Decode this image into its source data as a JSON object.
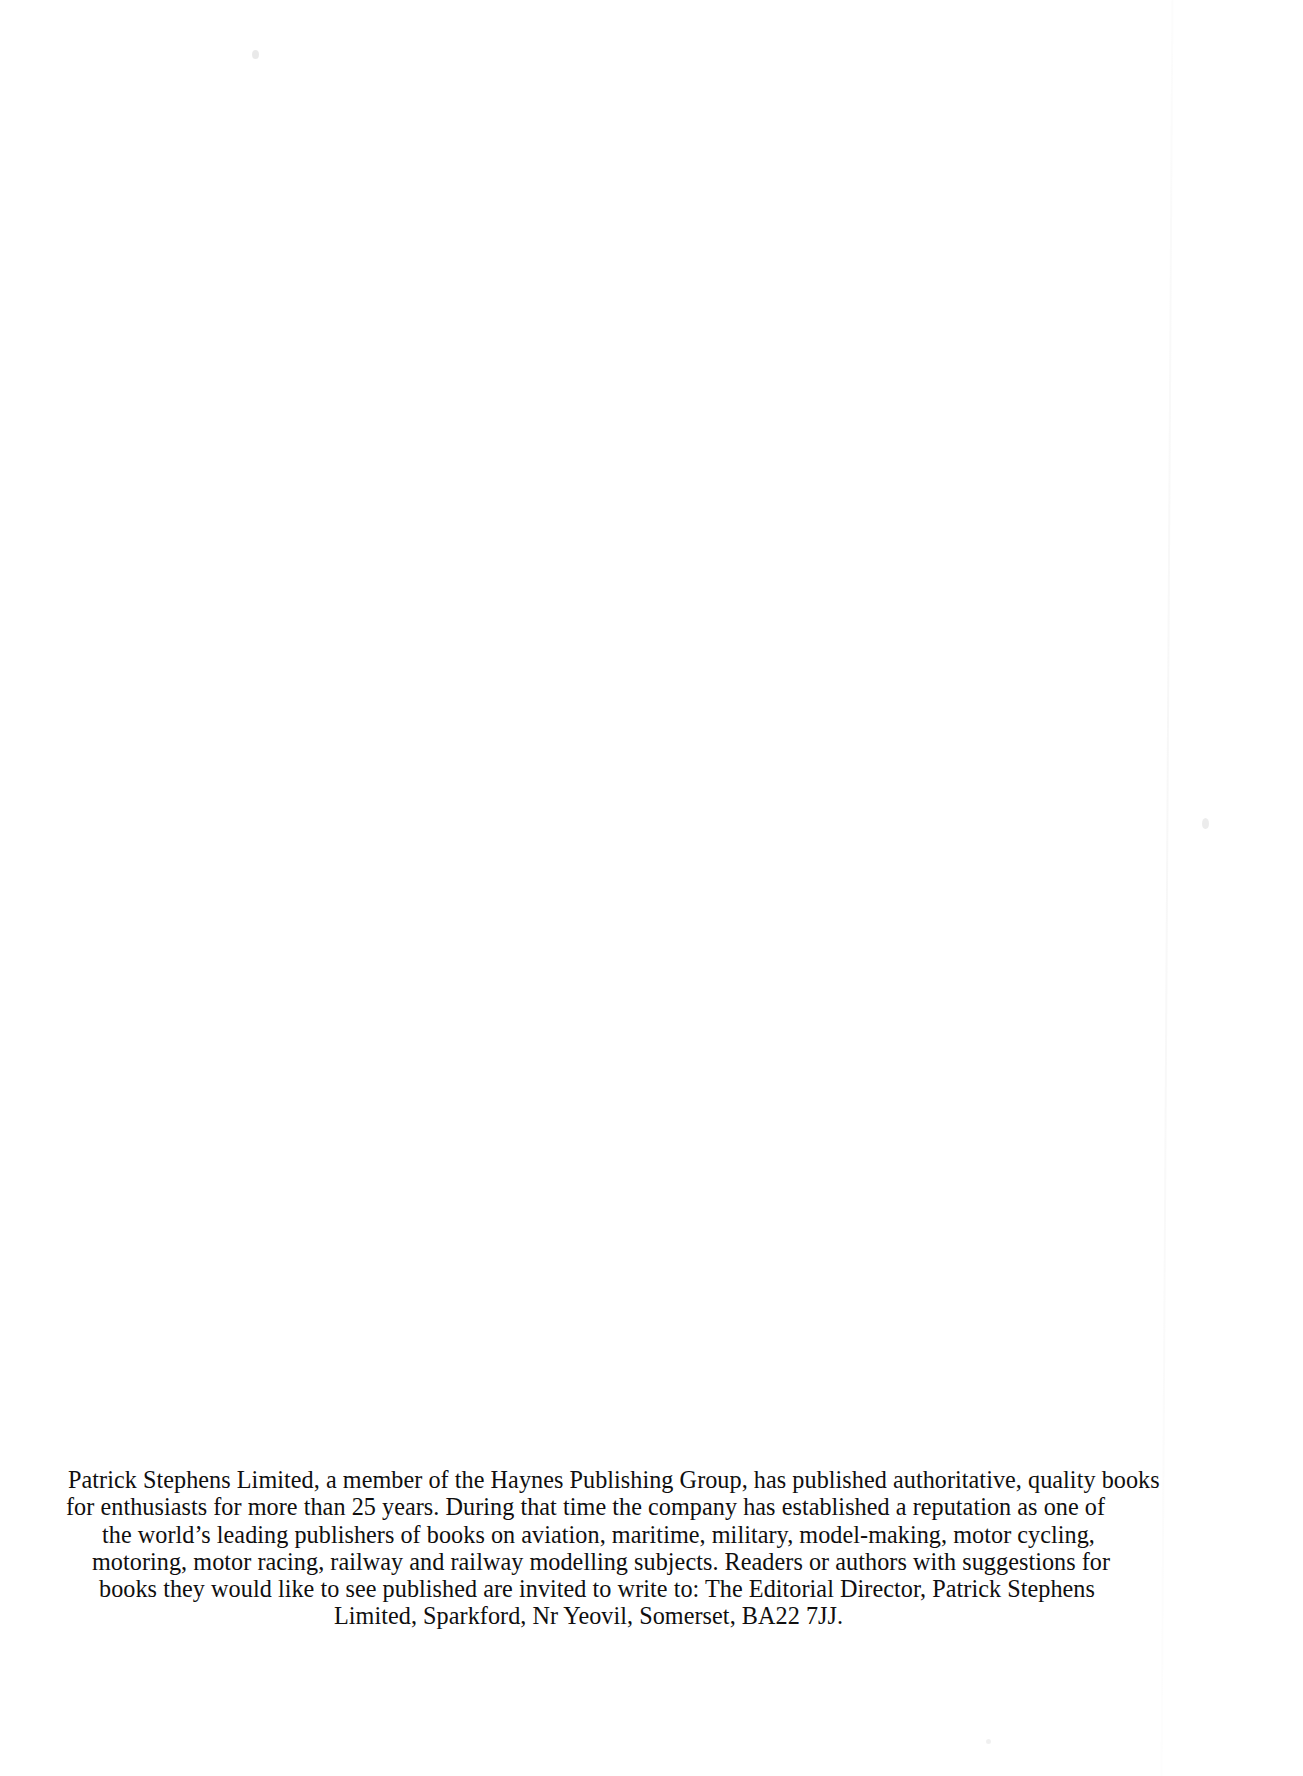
{
  "page": {
    "kind": "scanned-book-page",
    "background_color": "#ffffff",
    "text_color": "#100f0f",
    "width": 1303,
    "height": 1776
  },
  "publisher_note": {
    "full_text": "Patrick Stephens Limited, a member of the Haynes Publishing Group, has published authoritative, quality books for enthusiasts for more than 25 years. During that time the company has established a reputation as one of the world's leading publishers of books on aviation, maritime, military, model-making, motor cycling, motoring, motor racing, railway and railway modelling subjects. Readers or authors with suggestions for books they would like to see published are invited to write to: The Editorial Director, Patrick Stephens Limited, Sparkford, Nr Yeovil, Somerset, BA22 7JJ.",
    "lines": [
      "Patrick Stephens Limited, a member of the Haynes Publishing Group, has published authoritative, quality books",
      "for enthusiasts for more than 25 years. During that time the company has established a reputation as one of",
      "the world’s leading publishers of books on aviation, maritime, military, model-making, motor cycling,",
      "motoring, motor racing, railway and railway modelling subjects. Readers or authors with suggestions for",
      "books they would like to see published are invited to write to: The Editorial Director, Patrick Stephens",
      "Limited, Sparkford, Nr Yeovil, Somerset, BA22 7JJ."
    ],
    "publisher": "Patrick Stephens Limited",
    "parent_group": "Haynes Publishing Group",
    "years_publishing": "25 years",
    "subjects": "aviation, maritime, military, model-making, motor cycling, motoring, motor racing, railway and railway modelling",
    "contact_role": "The Editorial Director",
    "address": "Patrick Stephens Limited, Sparkford, Nr Yeovil, Somerset, BA22 7JJ",
    "postcode": "BA22 7JJ"
  },
  "artifacts": {
    "scan_edge": "faint-vertical-page-edge",
    "specks": [
      "dust-speck-top-left",
      "dust-speck-bottom-right"
    ]
  }
}
